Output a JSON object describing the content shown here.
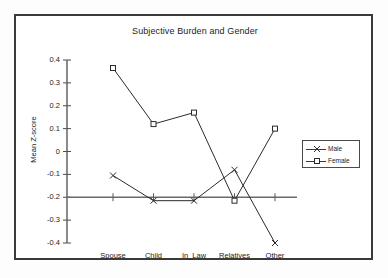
{
  "chart_data": {
    "type": "line",
    "title": "Subjective Burden and Gender",
    "xlabel": "",
    "ylabel": "Mean Z-score",
    "categories": [
      "Spouse",
      "Child",
      "In_Law",
      "Relatives",
      "Other"
    ],
    "yticks": [
      "0.4",
      "0.3",
      "0.2",
      "0.1",
      "0",
      "-0.1",
      "-0.2",
      "-0.3",
      "-0.4"
    ],
    "ylim": [
      -0.4,
      0.4
    ],
    "grid": false,
    "legend_position": "right",
    "axis_baseline": -0.2,
    "series": [
      {
        "name": "Male",
        "marker": "x",
        "color": "#2b2b2b",
        "values": [
          -0.105,
          -0.215,
          -0.215,
          -0.08,
          -0.4
        ]
      },
      {
        "name": "Female",
        "marker": "square",
        "color": "#2b2b2b",
        "values": [
          0.365,
          0.12,
          0.17,
          -0.215,
          0.1
        ]
      }
    ]
  },
  "legend": {
    "items": [
      {
        "label": "Male"
      },
      {
        "label": "Female"
      }
    ]
  }
}
